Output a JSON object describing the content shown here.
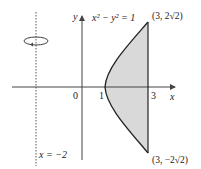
{
  "figure": {
    "equation_label": "x² − y² = 1",
    "axis_x_label": "x",
    "axis_y_label": "y",
    "origin_label": "0",
    "tick_1_label": "1",
    "tick_3_label": "3",
    "point_top_label": "(3, 2√2)",
    "point_bottom_label": "(3, −2√2)",
    "rotation_axis_label": "x = −2",
    "rotation_icon": "rotation-arrow-icon",
    "colors": {
      "axis": "#444444",
      "curve": "#222222",
      "region_fill": "#d9d9d9",
      "dotted_line": "#555555"
    }
  }
}
